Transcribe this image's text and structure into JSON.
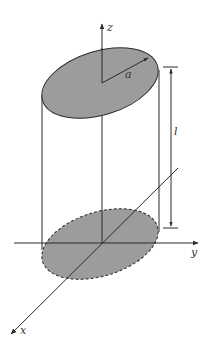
{
  "diagram": {
    "axes": {
      "x_label": "x",
      "y_label": "y",
      "z_label": "z"
    },
    "labels": {
      "radius": "a",
      "length": "l"
    },
    "colors": {
      "line": "#2a2a2a",
      "fill": "#9c9c9c",
      "background": "#ffffff"
    }
  }
}
